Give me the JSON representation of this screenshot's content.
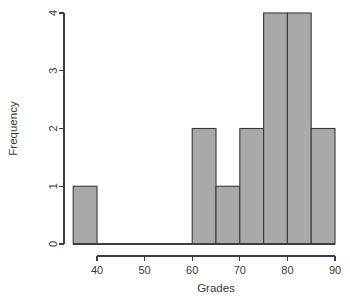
{
  "chart_data": {
    "type": "bar",
    "subtype": "histogram",
    "title": "",
    "xlabel": "Grades",
    "ylabel": "Frequency",
    "xlim": [
      35,
      90
    ],
    "ylim": [
      0,
      4
    ],
    "xticks": [
      40,
      50,
      60,
      70,
      80,
      90
    ],
    "xtick_labels": [
      "40",
      "50",
      "60",
      "70",
      "80",
      "90"
    ],
    "yticks": [
      0,
      1,
      2,
      3,
      4
    ],
    "ytick_labels": [
      "0",
      "1",
      "2",
      "3",
      "4"
    ],
    "grid": false,
    "legend": false,
    "bin_width": 5,
    "bar_fill_color": "#a9a9a9",
    "bar_edge_color": "#3a3a3a",
    "axis_color": "#3d3d3d",
    "background_color": "#ffffff",
    "bins": [
      {
        "left": 35,
        "right": 40,
        "count": 1
      },
      {
        "left": 40,
        "right": 45,
        "count": 0
      },
      {
        "left": 45,
        "right": 50,
        "count": 0
      },
      {
        "left": 50,
        "right": 55,
        "count": 0
      },
      {
        "left": 55,
        "right": 60,
        "count": 0
      },
      {
        "left": 60,
        "right": 65,
        "count": 2
      },
      {
        "left": 65,
        "right": 70,
        "count": 1
      },
      {
        "left": 70,
        "right": 75,
        "count": 2
      },
      {
        "left": 75,
        "right": 80,
        "count": 4
      },
      {
        "left": 80,
        "right": 85,
        "count": 4
      },
      {
        "left": 85,
        "right": 90,
        "count": 2
      }
    ],
    "categories": [
      "35-40",
      "40-45",
      "45-50",
      "50-55",
      "55-60",
      "60-65",
      "65-70",
      "70-75",
      "75-80",
      "80-85",
      "85-90"
    ],
    "values": [
      1,
      0,
      0,
      0,
      0,
      2,
      1,
      2,
      4,
      4,
      2
    ]
  }
}
